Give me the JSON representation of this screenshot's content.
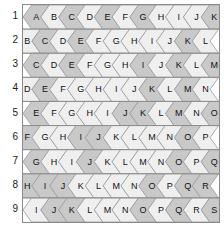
{
  "figure": {
    "type": "hex-tessellation-grid",
    "rows": 9,
    "cols": 11,
    "row_labels": [
      "1",
      "2",
      "3",
      "4",
      "5",
      "6",
      "7",
      "8",
      "9"
    ],
    "letters": [
      [
        "A",
        "B",
        "C",
        "D",
        "E",
        "F",
        "G",
        "H",
        "I",
        "J",
        "K"
      ],
      [
        "B",
        "C",
        "D",
        "E",
        "F",
        "G",
        "H",
        "I",
        "J",
        "K",
        "L"
      ],
      [
        "C",
        "D",
        "E",
        "F",
        "G",
        "H",
        "I",
        "J",
        "K",
        "L",
        "M"
      ],
      [
        "D",
        "E",
        "F",
        "G",
        "H",
        "I",
        "J",
        "K",
        "L",
        "M",
        "N"
      ],
      [
        "E",
        "F",
        "G",
        "H",
        "I",
        "J",
        "K",
        "L",
        "M",
        "N",
        "O"
      ],
      [
        "F",
        "G",
        "H",
        "I",
        "J",
        "K",
        "L",
        "M",
        "N",
        "O",
        "P"
      ],
      [
        "G",
        "H",
        "I",
        "J",
        "K",
        "L",
        "M",
        "N",
        "O",
        "P",
        "Q"
      ],
      [
        "H",
        "I",
        "J",
        "K",
        "L",
        "M",
        "N",
        "O",
        "P",
        "Q",
        "R"
      ],
      [
        "I",
        "J",
        "K",
        "L",
        "M",
        "N",
        "O",
        "P",
        "Q",
        "R",
        "S"
      ]
    ],
    "shading": [
      [
        1,
        0,
        1,
        0,
        1,
        0,
        1,
        0,
        0,
        0,
        1
      ],
      [
        0,
        1,
        0,
        1,
        0,
        0,
        0,
        0,
        0,
        1,
        0
      ],
      [
        1,
        0,
        1,
        0,
        0,
        0,
        1,
        0,
        1,
        0,
        1
      ],
      [
        0,
        1,
        0,
        0,
        0,
        0,
        0,
        1,
        0,
        1,
        0
      ],
      [
        1,
        0,
        0,
        0,
        0,
        1,
        1,
        0,
        1,
        0,
        1
      ],
      [
        1,
        0,
        0,
        1,
        1,
        0,
        0,
        0,
        0,
        1,
        0
      ],
      [
        1,
        0,
        0,
        1,
        0,
        0,
        0,
        0,
        1,
        0,
        1
      ],
      [
        1,
        1,
        1,
        0,
        0,
        0,
        0,
        1,
        0,
        1,
        1
      ],
      [
        0,
        1,
        1,
        0,
        0,
        0,
        1,
        0,
        1,
        0,
        1
      ]
    ],
    "colors": {
      "shade_dark": "#c9c9c9",
      "shade_light": "#efefef",
      "cell_stroke": "#9a9a9a",
      "band_stroke": "#8c8c8c",
      "border": "#8a8a8a",
      "text": "#111111",
      "background": "#ffffff"
    }
  }
}
